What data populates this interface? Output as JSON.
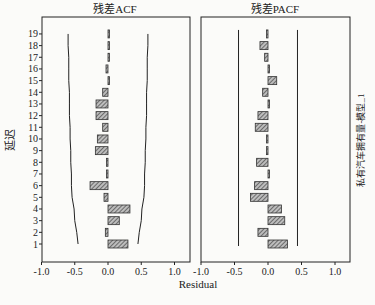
{
  "chart_data": [
    {
      "type": "bar",
      "orientation": "horizontal",
      "title": "残差ACF",
      "xlabel": "Residual",
      "ylabel": "延迟",
      "xlim": [
        -1.0,
        1.0
      ],
      "xticks": [
        "-1.0",
        "-0.5",
        "0.0",
        "0.5",
        "1.0"
      ],
      "categories": [
        1,
        2,
        3,
        4,
        5,
        6,
        7,
        8,
        9,
        10,
        11,
        12,
        13,
        14,
        15,
        16,
        17,
        18,
        19
      ],
      "values": [
        0.3,
        -0.04,
        0.17,
        0.33,
        -0.06,
        -0.27,
        -0.01,
        -0.02,
        -0.19,
        -0.16,
        -0.08,
        -0.18,
        -0.18,
        -0.08,
        0.02,
        -0.03,
        0.0,
        0.02,
        0.02
      ],
      "confidence_limits": {
        "upper": [
          0.45,
          0.47,
          0.5,
          0.51,
          0.54,
          0.55,
          0.55,
          0.56,
          0.56,
          0.57,
          0.57,
          0.58,
          0.58,
          0.58,
          0.59,
          0.59,
          0.59,
          0.6,
          0.6
        ],
        "lower": [
          -0.45,
          -0.47,
          -0.5,
          -0.51,
          -0.54,
          -0.55,
          -0.55,
          -0.56,
          -0.56,
          -0.57,
          -0.57,
          -0.58,
          -0.58,
          -0.58,
          -0.59,
          -0.59,
          -0.59,
          -0.6,
          -0.6
        ]
      },
      "grid": false
    },
    {
      "type": "bar",
      "orientation": "horizontal",
      "title": "残差PACF",
      "xlabel": "Residual",
      "ylabel": "",
      "xlim": [
        -1.0,
        1.0
      ],
      "xticks": [
        "-1.0",
        "-0.5",
        "0.0",
        "0.5",
        "1.0"
      ],
      "categories": [
        1,
        2,
        3,
        4,
        5,
        6,
        7,
        8,
        9,
        10,
        11,
        12,
        13,
        14,
        15,
        16,
        17,
        18,
        19
      ],
      "values": [
        0.29,
        -0.15,
        0.25,
        0.2,
        -0.26,
        -0.2,
        0.02,
        -0.17,
        -0.01,
        -0.02,
        -0.19,
        -0.15,
        0.0,
        -0.08,
        0.13,
        0.0,
        -0.05,
        -0.12,
        -0.02
      ],
      "confidence_limits": {
        "upper": 0.44,
        "lower": -0.44
      },
      "grid": false
    }
  ],
  "labels": {
    "left_title": "残差ACF",
    "right_title": "残差PACF",
    "y_axis_label": "延迟",
    "x_axis_label": "Residual",
    "side_label": "私有汽车拥有量-模型_1"
  },
  "colors": {
    "bar_fill": "#9a9a9a",
    "bar_hatch": "#333333",
    "axis": "#222222",
    "background": "#fbfbf9"
  }
}
